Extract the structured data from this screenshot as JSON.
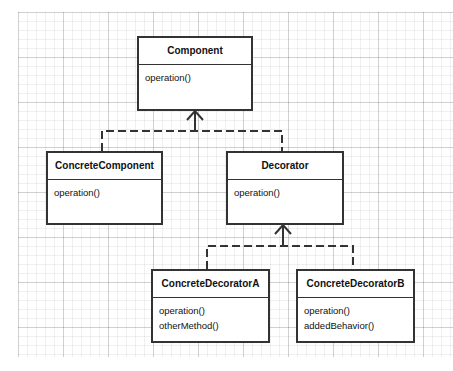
{
  "diagram": {
    "type": "UML class diagram",
    "pattern": "Decorator",
    "classes": [
      {
        "id": "component",
        "name": "Component",
        "operations": [
          "operation()"
        ]
      },
      {
        "id": "concrete_component",
        "name": "ConcreteComponent",
        "operations": [
          "operation()"
        ]
      },
      {
        "id": "decorator",
        "name": "Decorator",
        "operations": [
          "operation()"
        ]
      },
      {
        "id": "concrete_decorator_a",
        "name": "ConcreteDecoratorA",
        "operations": [
          "operation()",
          "otherMethod()"
        ]
      },
      {
        "id": "concrete_decorator_b",
        "name": "ConcreteDecoratorB",
        "operations": [
          "operation()",
          "addedBehavior()"
        ]
      }
    ],
    "relations": [
      {
        "from": "ConcreteComponent",
        "to": "Component",
        "kind": "realization"
      },
      {
        "from": "Decorator",
        "to": "Component",
        "kind": "realization"
      },
      {
        "from": "ConcreteDecoratorA",
        "to": "Decorator",
        "kind": "realization"
      },
      {
        "from": "ConcreteDecoratorB",
        "to": "Decorator",
        "kind": "realization"
      }
    ],
    "colors": {
      "stroke": "#333333",
      "fill": "#ffffff",
      "grid": "#dddddd"
    }
  }
}
